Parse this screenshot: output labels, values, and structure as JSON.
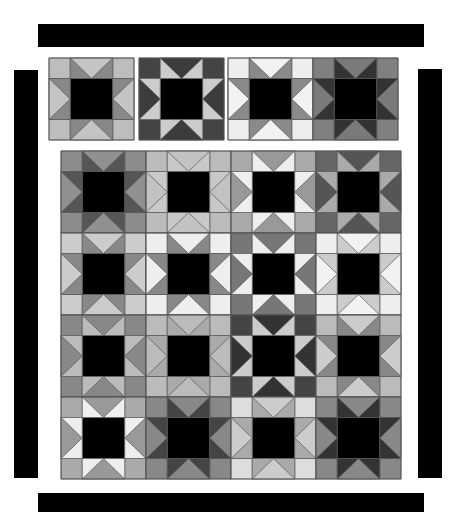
{
  "diagram": {
    "type": "quilt-layout",
    "center_color": "#000000",
    "seam_color": "#555555",
    "borders": {
      "top": {
        "x": 38,
        "y": 24,
        "w": 386,
        "h": 23
      },
      "left": {
        "x": 14,
        "y": 70,
        "w": 24,
        "h": 408
      },
      "right": {
        "x": 418,
        "y": 69,
        "w": 24,
        "h": 409
      },
      "bottom": {
        "x": 38,
        "y": 493,
        "w": 386,
        "h": 19
      }
    },
    "sample_row": {
      "x": 49,
      "y": 58,
      "block_w": 85,
      "block_h": 82,
      "gaps": [
        0,
        5,
        4,
        0
      ],
      "blocks": [
        {
          "corner": "#bdbdbd",
          "goose": "#c4c4c4",
          "points": "#888888"
        },
        {
          "corner": "#444444",
          "goose": "#3c3c3c",
          "points": "#cccccc"
        },
        {
          "corner": "#eeeeee",
          "goose": "#f2f2f2",
          "points": "#8a8a8a"
        },
        {
          "corner": "#808080",
          "goose": "#7a7a7a",
          "points": "#333333"
        }
      ]
    },
    "main_grid": {
      "x": 61,
      "y": 151,
      "block_w": 85,
      "block_h": 82,
      "rows": 4,
      "cols": 4,
      "blocks": [
        [
          {
            "corner": "#8c8c8c",
            "goose": "#909090",
            "points": "#555555"
          },
          {
            "corner": "#bbbbbb",
            "goose": "#c2c2c2",
            "points": "#c8c8c8"
          },
          {
            "corner": "#aaaaaa",
            "goose": "#999999",
            "points": "#eeeeee"
          },
          {
            "corner": "#666666",
            "goose": "#555555",
            "points": "#aaaaaa"
          }
        ],
        [
          {
            "corner": "#cccccc",
            "goose": "#cccccc",
            "points": "#888888"
          },
          {
            "corner": "#eeeeee",
            "goose": "#eeeeee",
            "points": "#888888"
          },
          {
            "corner": "#777777",
            "goose": "#777777",
            "points": "#eeeeee"
          },
          {
            "corner": "#eeeeee",
            "goose": "#f2f2f2",
            "points": "#cccccc"
          }
        ],
        [
          {
            "corner": "#888888",
            "goose": "#888888",
            "points": "#bbbbbb"
          },
          {
            "corner": "#bbbbbb",
            "goose": "#bbbbbb",
            "points": "#aaaaaa"
          },
          {
            "corner": "#444444",
            "goose": "#333333",
            "points": "#cccccc"
          },
          {
            "corner": "#bbbbbb",
            "goose": "#cccccc",
            "points": "#888888"
          }
        ],
        [
          {
            "corner": "#aaaaaa",
            "goose": "#999999",
            "points": "#eeeeee"
          },
          {
            "corner": "#888888",
            "goose": "#888888",
            "points": "#444444"
          },
          {
            "corner": "#dddddd",
            "goose": "#cccccc",
            "points": "#aaaaaa"
          },
          {
            "corner": "#888888",
            "goose": "#888888",
            "points": "#333333"
          }
        ]
      ]
    }
  }
}
